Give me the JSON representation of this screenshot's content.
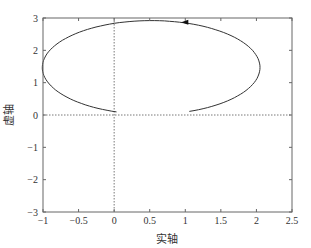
{
  "chart_data": {
    "type": "line",
    "title": "",
    "xlabel": "实轴",
    "ylabel": "虚轴",
    "xlim": [
      -1,
      2.5
    ],
    "ylim": [
      -3,
      3
    ],
    "xticks": [
      -1,
      -0.5,
      0,
      0.5,
      1,
      1.5,
      2,
      2.5
    ],
    "xtick_labels": [
      "−1",
      "−0.5",
      "0",
      "0.5",
      "1",
      "1.5",
      "2",
      "2.5"
    ],
    "yticks": [
      -3,
      -2,
      -1,
      0,
      1,
      2,
      3
    ],
    "ytick_labels": [
      "−3",
      "−2",
      "−1",
      "0",
      "1",
      "2",
      "3"
    ],
    "grid": false,
    "reference_lines": [
      {
        "orientation": "vertical",
        "value": 0,
        "style": "dotted"
      },
      {
        "orientation": "horizontal",
        "value": 0,
        "style": "dotted"
      }
    ],
    "series": [
      {
        "name": "locus",
        "description": "Elliptical arc, open at bottom, from (1.1, 0) counter-clockwise over the top to (0, 0)",
        "x": [
          1.1,
          1.6,
          1.95,
          2.05,
          1.95,
          1.6,
          1.1,
          0.55,
          0.0,
          -0.5,
          -0.85,
          -1.0,
          -0.85,
          -0.5,
          0.0
        ],
        "y": [
          0.0,
          0.3,
          0.9,
          1.5,
          2.1,
          2.6,
          2.85,
          2.92,
          2.85,
          2.55,
          2.05,
          1.5,
          0.9,
          0.35,
          0.0
        ],
        "direction_arrow": {
          "x": 1.0,
          "y": 2.87,
          "points": "left"
        }
      }
    ],
    "colors": {
      "line": "#333333",
      "axes": "#555555",
      "reference": "#555555"
    }
  }
}
